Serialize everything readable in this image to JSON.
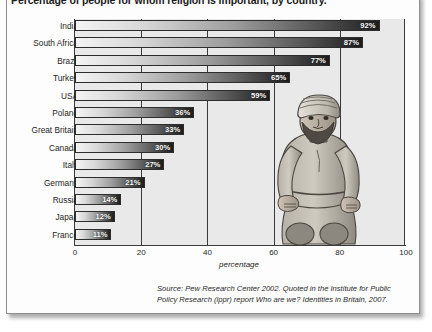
{
  "chart_data": {
    "type": "bar",
    "orientation": "horizontal",
    "title": "Percentage of people for whom religion is important, by country.",
    "xlabel": "percentage",
    "ylabel": "",
    "xlim": [
      0,
      100
    ],
    "xticks": [
      0,
      20,
      40,
      60,
      80,
      100
    ],
    "xtick_labels": [
      "0",
      "20",
      "40",
      "60",
      "80",
      "100"
    ],
    "grid": true,
    "legend": false,
    "categories": [
      "India",
      "South Africa",
      "Brazil",
      "Turkey",
      "USA",
      "Poland",
      "Great Britain",
      "Canada",
      "Italy",
      "Germany",
      "Russia",
      "Japan",
      "France"
    ],
    "values": [
      92,
      87,
      77,
      65,
      59,
      36,
      33,
      30,
      27,
      21,
      14,
      12,
      11
    ],
    "value_labels": [
      "92%",
      "87%",
      "77%",
      "65%",
      "59%",
      "36%",
      "33%",
      "30%",
      "27%",
      "21%",
      "14%",
      "12%",
      "11%"
    ],
    "bar_style": "grayscale gradient light-to-dark, left to right",
    "source": "Source: Pew Research Center 2002. Quoted in the Institute for Public Policy Research (ippr) report Who are we? Identities in Britain, 2007."
  },
  "illustration": {
    "name": "praying-man-illustration",
    "description": "Grayscale drawing of a kneeling bearded man wearing a turban"
  },
  "colors": {
    "card_background": "#fdfdfd",
    "plot_background": "#e9e9e9",
    "axis": "#3a3a3a",
    "bar_light": "#f4f4f4",
    "bar_dark": "#1d1d1d",
    "text": "#1d1d1d",
    "value_label": "#ffffff"
  }
}
